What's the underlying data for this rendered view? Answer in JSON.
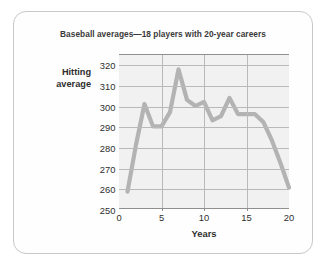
{
  "chart_data": {
    "type": "line",
    "title": "Baseball averages—18 players with 20-year careers",
    "xlabel": "Years",
    "ylabel": "Hitting average",
    "ylabel_line1": "Hitting",
    "ylabel_line2": "average",
    "xlim": [
      0,
      20
    ],
    "ylim": [
      250,
      325
    ],
    "grid": true,
    "legend": "none",
    "yticks": [
      250,
      260,
      270,
      280,
      290,
      300,
      310,
      320
    ],
    "xticks": [
      0,
      5,
      10,
      15,
      20
    ],
    "x": [
      1,
      2,
      3,
      4,
      5,
      6,
      7,
      8,
      9,
      10,
      11,
      12,
      13,
      14,
      15,
      16,
      17,
      18,
      19,
      20
    ],
    "values": [
      258,
      281,
      301,
      290,
      290,
      297,
      318,
      303,
      300,
      302,
      293,
      295,
      304,
      296,
      296,
      296,
      292,
      283,
      272,
      260
    ],
    "series": [
      {
        "name": "Hitting average",
        "color": "#b3b3b3",
        "values": [
          258,
          281,
          301,
          290,
          290,
          297,
          318,
          303,
          300,
          302,
          293,
          295,
          304,
          296,
          296,
          296,
          292,
          283,
          272,
          260
        ]
      }
    ]
  },
  "colors": {
    "line": "#b3b3b3",
    "plot_background": "#f1f1f1",
    "gridline": "#b9b9b9",
    "axis": "#8f8f8f",
    "card_border": "#c8c8c8",
    "text": "#2e2e2e"
  }
}
